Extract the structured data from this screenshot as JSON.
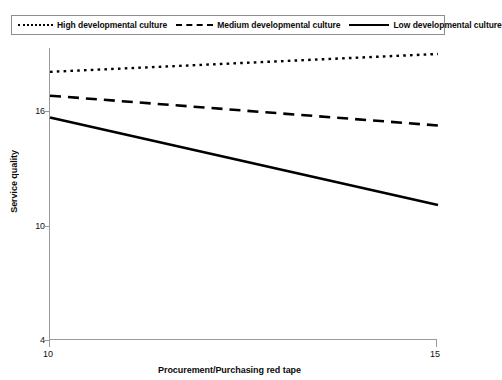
{
  "chart_data": {
    "type": "line",
    "title": "",
    "xlabel": "Procurement/Purchasing red tape",
    "ylabel": "Service quality",
    "xlim": [
      10,
      15
    ],
    "ylim": [
      4,
      18.7
    ],
    "xticks": [
      10,
      15
    ],
    "xtick_labels": [
      "10",
      "15"
    ],
    "yticks": [
      4,
      10,
      16
    ],
    "ytick_labels": [
      "4",
      "10",
      "16"
    ],
    "grid": false,
    "legend_position": "top",
    "x": [
      10,
      15
    ],
    "series": [
      {
        "name": "High developmental culture",
        "style": "dotted",
        "color": "#000000",
        "values": [
          17.5,
          18.4
        ]
      },
      {
        "name": "Medium developmental culture",
        "style": "dashed",
        "color": "#000000",
        "values": [
          16.3,
          14.8
        ]
      },
      {
        "name": "Low developmental culture",
        "style": "solid",
        "color": "#000000",
        "values": [
          15.2,
          10.8
        ]
      }
    ]
  },
  "legend": {
    "items": [
      {
        "label": "High developmental culture",
        "swatch": "dotted-line-swatch"
      },
      {
        "label": "Medium developmental culture",
        "swatch": "dashed-line-swatch"
      },
      {
        "label": "Low developmental culture",
        "swatch": "solid-line-swatch"
      }
    ]
  },
  "axes": {
    "y_title": "Service quality",
    "x_title": "Procurement/Purchasing red tape",
    "y_tick_labels": [
      "16",
      "10",
      "4"
    ],
    "x_tick_labels": [
      "10",
      "15"
    ]
  }
}
